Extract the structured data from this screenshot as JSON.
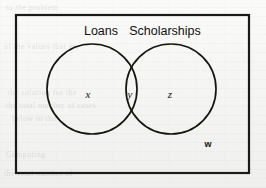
{
  "diagram": {
    "type": "venn-2-set",
    "caption_absent": true,
    "universe": {
      "label": "w",
      "label_x": 208,
      "label_y": 144,
      "rect": {
        "x": 16,
        "y": 15,
        "width": 233,
        "height": 158
      },
      "border_color": "#1a1a18",
      "border_width": 2.2
    },
    "sets": [
      {
        "name": "loans",
        "title": "Loans",
        "title_x": 101,
        "title_y": 25,
        "circle": {
          "cx": 92,
          "cy": 89,
          "r": 45
        },
        "region_label": "x",
        "region_label_x": 88,
        "region_label_y": 94
      },
      {
        "name": "scholarships",
        "title": "Scholarships",
        "title_x": 165,
        "title_y": 25,
        "circle": {
          "cx": 171,
          "cy": 89,
          "r": 45
        },
        "region_label": "z",
        "region_label_x": 170,
        "region_label_y": 94
      }
    ],
    "intersection": {
      "label": "y",
      "label_x": 130,
      "label_y": 94
    },
    "stroke_color": "#16160f",
    "stroke_width": 1.7,
    "background_color": "#f5f5f3"
  },
  "ghost_lines": [
    {
      "text": "to the problem",
      "x": 6,
      "y": 3
    },
    {
      "text": "of the values that are",
      "x": 4,
      "y": 42
    },
    {
      "text": "the solution for the",
      "x": 8,
      "y": 88
    },
    {
      "text": "the total number of cases",
      "x": 6,
      "y": 101
    },
    {
      "text": "below in the",
      "x": 12,
      "y": 114
    },
    {
      "text": "Computing",
      "x": 6,
      "y": 150
    },
    {
      "text": "the total number of",
      "x": 4,
      "y": 169
    }
  ]
}
